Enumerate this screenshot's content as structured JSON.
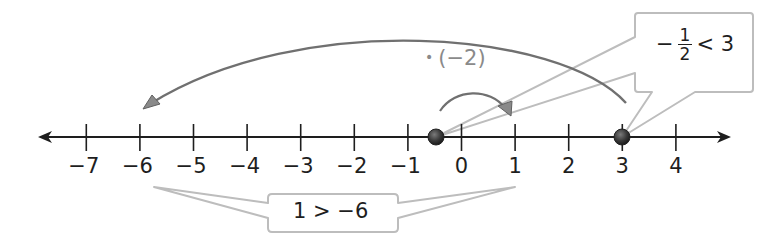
{
  "diagram": {
    "type": "number-line",
    "colors": {
      "axis": "#1e1e1e",
      "arc": "#707070",
      "callout_stroke": "#bdbdbd",
      "point": "#3a3a3a",
      "hint_text": "#8a8a8a"
    },
    "axis": {
      "min": -7,
      "max": 4,
      "ticks": [
        {
          "value": -7,
          "label": "−7"
        },
        {
          "value": -6,
          "label": "−6"
        },
        {
          "value": -5,
          "label": "−5"
        },
        {
          "value": -4,
          "label": "−4"
        },
        {
          "value": -3,
          "label": "−3"
        },
        {
          "value": -2,
          "label": "−2"
        },
        {
          "value": -1,
          "label": "−1"
        },
        {
          "value": 0,
          "label": "0"
        },
        {
          "value": 1,
          "label": "1"
        },
        {
          "value": 2,
          "label": "2"
        },
        {
          "value": 3,
          "label": "3"
        },
        {
          "value": 4,
          "label": "4"
        }
      ],
      "arrows": "both"
    },
    "points": [
      {
        "value": -0.5,
        "label": "−1/2"
      },
      {
        "value": 3,
        "label": "3"
      }
    ],
    "arcs": [
      {
        "from": 3,
        "to": -6,
        "description": "large arc from 3 to −6"
      },
      {
        "from": -0.5,
        "to": 1,
        "description": "small arc from −1/2 to 1"
      }
    ],
    "hint": {
      "bullet": "•",
      "text": "(−2)"
    },
    "callouts": {
      "top": {
        "minus": "−",
        "numerator": "1",
        "denominator": "2",
        "relation": "< 3",
        "full_text": "−1/2 < 3"
      },
      "bottom": {
        "text": "1 > −6"
      }
    }
  }
}
